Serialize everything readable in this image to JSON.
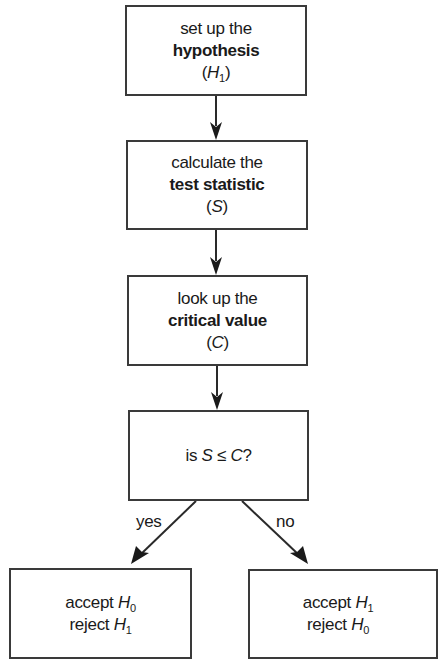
{
  "diagram": {
    "type": "flowchart",
    "nodes": [
      {
        "id": "hypothesis",
        "line1": "set up the",
        "line2_bold": "hypothesis",
        "line3_prefix": "(",
        "line3_var": "H",
        "line3_sub": "1",
        "line3_suffix": ")"
      },
      {
        "id": "test-statistic",
        "line1": "calculate the",
        "line2_bold": "test statistic",
        "line3_prefix": "(",
        "line3_var": "S",
        "line3_suffix": ")"
      },
      {
        "id": "critical-value",
        "line1": "look up the",
        "line2_bold": "critical value",
        "line3_prefix": "(",
        "line3_var": "C",
        "line3_suffix": ")"
      },
      {
        "id": "decision",
        "text_prefix": "is ",
        "var_a": "S",
        "operator": " ≤ ",
        "var_b": "C",
        "text_suffix": "?"
      },
      {
        "id": "accept-null",
        "line1_text": "accept ",
        "line1_var": "H",
        "line1_sub": "0",
        "line2_text": "reject ",
        "line2_var": "H",
        "line2_sub": "1"
      },
      {
        "id": "accept-alternative",
        "line1_text": "accept ",
        "line1_var": "H",
        "line1_sub": "1",
        "line2_text": "reject ",
        "line2_var": "H",
        "line2_sub": "0"
      }
    ],
    "edges": [
      {
        "from": "hypothesis",
        "to": "test-statistic",
        "label": ""
      },
      {
        "from": "test-statistic",
        "to": "critical-value",
        "label": ""
      },
      {
        "from": "critical-value",
        "to": "decision",
        "label": ""
      },
      {
        "from": "decision",
        "to": "accept-null",
        "label": "yes"
      },
      {
        "from": "decision",
        "to": "accept-alternative",
        "label": "no"
      }
    ],
    "colors": {
      "stroke": "#3a3a3a",
      "text": "#1a1a1a",
      "background": "#ffffff"
    }
  }
}
